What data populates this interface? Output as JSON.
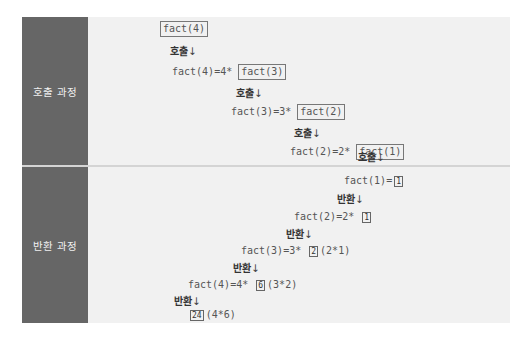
{
  "sections": {
    "call": {
      "label": "호출 과정"
    },
    "return": {
      "label": "반환 과정"
    }
  },
  "call_steps": {
    "s0_box": "fact(4)",
    "s1_word": "호출",
    "s2_prefix": "fact(4)=4*",
    "s2_box": "fact(3)",
    "s3_word": "호출",
    "s4_prefix": "fact(3)=3*",
    "s4_box": "fact(2)",
    "s5_word": "호출",
    "s6_prefix": "fact(2)=2*",
    "s6_box": "fact(1)",
    "s7_word": "호출"
  },
  "return_steps": {
    "r0_prefix": "fact(1)=",
    "r0_box": "1",
    "r1_word": "반환",
    "r2_prefix": "fact(2)=2*",
    "r2_box": "1",
    "r3_word": "반환",
    "r4_prefix": "fact(3)=3*",
    "r4_box": "2",
    "r4_suffix": "(2*1)",
    "r5_word": "반환",
    "r6_prefix": "fact(4)=4*",
    "r6_box": "6",
    "r6_suffix": "(3*2)",
    "r7_word": "반환",
    "r8_box": "24",
    "r8_suffix": "(4*6)"
  },
  "arrow": "↓"
}
